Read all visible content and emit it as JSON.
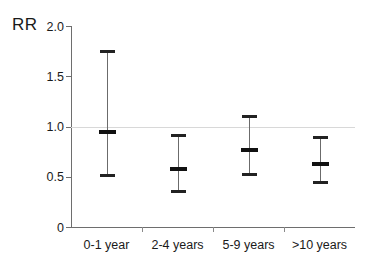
{
  "chart_data": {
    "type": "scatter",
    "title": "",
    "subtitle": "",
    "xlabel": "",
    "ylabel": "RR",
    "categories": [
      "0-1 year",
      "2-4 years",
      "5-9 years",
      ">10 years"
    ],
    "values": [
      0.95,
      0.58,
      0.77,
      0.63
    ],
    "ci_lower": [
      0.52,
      0.36,
      0.53,
      0.45
    ],
    "ci_upper": [
      1.75,
      0.92,
      1.1,
      0.9
    ],
    "ylim": [
      0,
      2.0
    ],
    "yticks": [
      0,
      0.5,
      1.0,
      1.5,
      2.0
    ],
    "ytick_labels": [
      "0",
      "0.5",
      "1.0",
      "1.5",
      "2.0"
    ],
    "reference_line": 1.0,
    "grid": false,
    "legend": "none",
    "series": [
      {
        "name": "Relative risk",
        "points": [
          {
            "category": "0-1 year",
            "value": 0.95,
            "low": 0.52,
            "high": 1.75
          },
          {
            "category": "2-4 years",
            "value": 0.58,
            "low": 0.36,
            "high": 0.92
          },
          {
            "category": "5-9 years",
            "value": 0.77,
            "low": 0.53,
            "high": 1.1
          },
          {
            "category": ">10 years",
            "value": 0.63,
            "low": 0.45,
            "high": 0.9
          }
        ]
      }
    ]
  },
  "colors": {
    "marker": "#111111",
    "cap": "#222222",
    "stem": "#6b6b6b",
    "axis": "#6e6e6e",
    "reference_line": "#d8d8d8",
    "background": "#ffffff",
    "text": "#1a1a1a"
  }
}
